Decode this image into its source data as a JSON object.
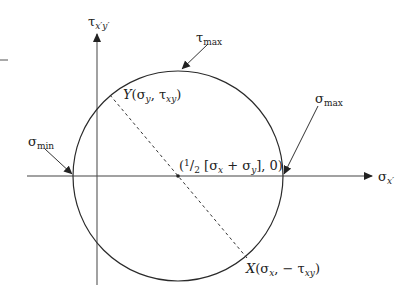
{
  "diagram": {
    "colors": {
      "line": "#2a2a2a",
      "axis": "#555555",
      "background": "#ffffff"
    },
    "axes": {
      "horizontal": {
        "symbol": "σ",
        "subscript": "x′"
      },
      "vertical": {
        "symbol": "τ",
        "subscript": "x′y′"
      }
    },
    "labels": {
      "tau_max": {
        "symbol": "τ",
        "subscript": "max"
      },
      "sigma_max": {
        "symbol": "σ",
        "subscript": "max"
      },
      "sigma_min": {
        "symbol": "σ",
        "subscript": "min"
      },
      "center": {
        "pre": "(",
        "half": "1",
        "slash": "/",
        "two": "2",
        "bracket_open": " [σ",
        "sx": "x",
        "plus": " + σ",
        "sy": "y",
        "rest": "], 0)"
      },
      "point_y": {
        "letter": "Y",
        "open": "(σ",
        "s1": "y",
        "comma": ", τ",
        "s2": "xy",
        "close": ")"
      },
      "point_x": {
        "letter": "X",
        "open": "(σ",
        "s1": "x",
        "comma": ", − τ",
        "s2": "xy",
        "close": ")"
      }
    },
    "geometry": {
      "center": [
        178,
        176
      ],
      "radius": 105,
      "point_y": [
        110,
        95
      ],
      "point_x": [
        247,
        258
      ]
    }
  }
}
